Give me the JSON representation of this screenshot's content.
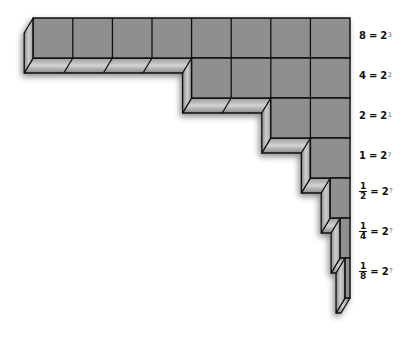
{
  "diagram": {
    "colors": {
      "front_face": "#8f8f8f",
      "side_face_light": "#c4c4c4",
      "side_face_dark": "#7a7a7a",
      "outline": "#111111",
      "background": "#ffffff"
    },
    "rows": [
      {
        "value": "8",
        "base": "2",
        "exponent": "3",
        "cells": 8,
        "fraction": false
      },
      {
        "value": "4",
        "base": "2",
        "exponent": "2",
        "cells": 4,
        "fraction": false
      },
      {
        "value": "2",
        "base": "2",
        "exponent": "1",
        "cells": 2,
        "fraction": false
      },
      {
        "value": "1",
        "base": "2",
        "exponent": "?",
        "cells": 1,
        "fraction": false
      },
      {
        "numerator": "1",
        "denominator": "2",
        "base": "2",
        "exponent": "?",
        "cells": 0.5,
        "fraction": true
      },
      {
        "numerator": "1",
        "denominator": "4",
        "base": "2",
        "exponent": "?",
        "cells": 0.25,
        "fraction": true
      },
      {
        "numerator": "1",
        "denominator": "8",
        "base": "2",
        "exponent": "?",
        "cells": 0.125,
        "fraction": true
      }
    ],
    "equals_sign": "="
  }
}
